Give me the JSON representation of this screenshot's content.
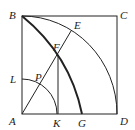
{
  "diagram": {
    "labels": {
      "B": "B",
      "C": "C",
      "E": "E",
      "F": "F",
      "L": "L",
      "P": "P",
      "A": "A",
      "K": "K",
      "G": "G",
      "D": "D"
    },
    "colors": {
      "stroke": "#222222",
      "background": "#ffffff"
    }
  }
}
